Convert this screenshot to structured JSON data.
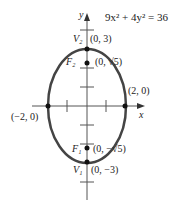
{
  "equation": "9x² + 4y² = 36",
  "axes": {
    "x_label": "x",
    "y_label": "y"
  },
  "points": {
    "v2": {
      "name": "V₂",
      "coord": "(0, 3)"
    },
    "f2": {
      "name": "F₂",
      "coord": "(0, √5)"
    },
    "right": {
      "coord": "(2, 0)"
    },
    "left": {
      "coord": "(−2, 0)"
    },
    "f1": {
      "name": "F₁",
      "coord": "(0, −√5)"
    },
    "v1": {
      "name": "V₁",
      "coord": "(0, −3)"
    }
  },
  "colors": {
    "curve": "#444444",
    "axis": "#555555",
    "point": "#111111"
  }
}
